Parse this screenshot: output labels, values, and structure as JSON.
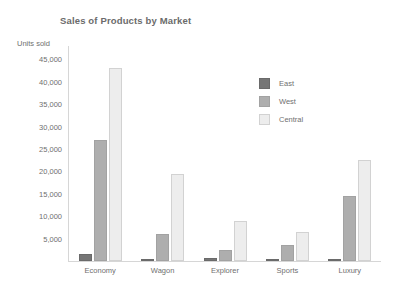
{
  "chart_data": {
    "type": "bar",
    "title": "Sales of Products by Market",
    "xlabel": "",
    "ylabel": "Units sold",
    "categories": [
      "Economy",
      "Wagon",
      "Explorer",
      "Sports",
      "Luxury"
    ],
    "series": [
      {
        "name": "East",
        "color": "#767676",
        "values": [
          1500,
          500,
          700,
          400,
          500
        ]
      },
      {
        "name": "West",
        "color": "#aeaeae",
        "values": [
          27000,
          6000,
          2500,
          3500,
          14500
        ]
      },
      {
        "name": "Central",
        "color": "#ededed",
        "values": [
          43000,
          19500,
          9000,
          6500,
          22500
        ]
      }
    ],
    "y_ticks": [
      5000,
      10000,
      15000,
      20000,
      25000,
      30000,
      35000,
      40000,
      45000
    ],
    "y_tick_labels": [
      "5,000",
      "10,000",
      "15,000",
      "20,000",
      "25,000",
      "30,000",
      "35,000",
      "40,000",
      "45,000"
    ],
    "ylim": [
      0,
      48000
    ],
    "grid": false,
    "legend_position": "inside-upper-right"
  },
  "legend": {
    "items": [
      {
        "label": "East"
      },
      {
        "label": "West"
      },
      {
        "label": "Central"
      }
    ]
  }
}
